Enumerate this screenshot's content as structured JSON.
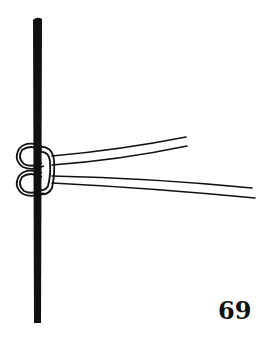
{
  "illustration": {
    "subject": "knot-diagram",
    "description": "Two cords tied with loops around a vertical rod, free ends extending right",
    "colors": {
      "ink": "#111111",
      "background": "#ffffff"
    }
  },
  "page_number": "69"
}
